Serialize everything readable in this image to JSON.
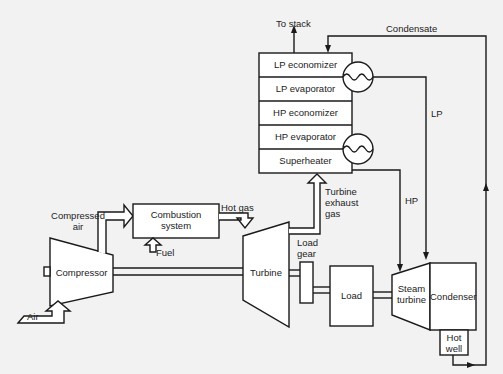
{
  "diagram": {
    "components": {
      "compressor": "Compressor",
      "combustion_system": "Combustion system",
      "turbine": "Turbine",
      "load_gear": "Load gear",
      "load": "Load",
      "steam_turbine": "Steam turbine",
      "condenser": "Condenser",
      "hot_well": "Hot well"
    },
    "hrsg_sections": [
      "LP economizer",
      "LP evaporator",
      "HP economizer",
      "HP evaporator",
      "Superheater"
    ],
    "flow_labels": {
      "air": "Air",
      "compressed_air": "Compressed air",
      "fuel": "Fuel",
      "hot_gas": "Hot gas",
      "turbine_exhaust_gas": "Turbine exhaust gas",
      "to_stack": "To stack",
      "condensate": "Condensate",
      "lp": "LP",
      "hp": "HP"
    },
    "drums": [
      "lp-drum",
      "hp-drum"
    ]
  }
}
